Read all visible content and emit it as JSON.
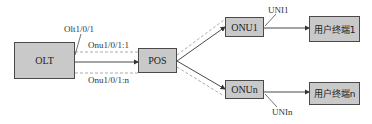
{
  "diagram": {
    "nodes": {
      "olt": {
        "label": "OLT"
      },
      "pos": {
        "label": "POS"
      },
      "onu1": {
        "label": "ONU1"
      },
      "onun": {
        "label": "ONUn"
      },
      "terminal1": {
        "label": "用户终端1"
      },
      "terminaln": {
        "label": "用户终端n"
      }
    },
    "labels": {
      "olt_port": "Olt1/0/1",
      "onu_link_1": "Onu1/0/1:1",
      "onu_link_n": "Onu1/0/1:n",
      "uni1": "UNI1",
      "unin": "UNIn"
    },
    "colors": {
      "box_fill": "#c9c9c9",
      "box_border": "#4a4a4a",
      "line": "#333333",
      "dashed_line": "#888888"
    }
  }
}
